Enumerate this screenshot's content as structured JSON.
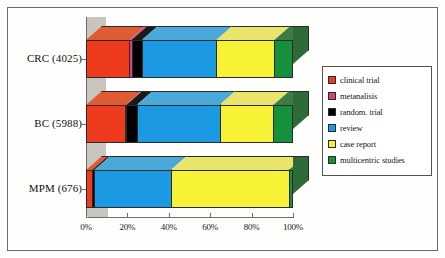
{
  "chart_data": {
    "type": "bar",
    "orientation": "horizontal",
    "stacked": true,
    "normalized_percent": true,
    "title": "",
    "xlabel": "",
    "ylabel": "",
    "xlim": [
      0,
      100
    ],
    "grid": false,
    "legend_position": "right",
    "categories": [
      "CRC (4025)",
      "BC (5988)",
      "MPM (676)"
    ],
    "xtick_labels": [
      "0%",
      "20%",
      "40%",
      "60%",
      "80%",
      "100%"
    ],
    "xtick_values": [
      0,
      20,
      40,
      60,
      80,
      100
    ],
    "series": [
      {
        "name": "clinical trial",
        "color": "#ef3b1d",
        "top_color": "#e05a32",
        "side_color": "#b82d15",
        "values": [
          21,
          19,
          3
        ]
      },
      {
        "name": "metanalisis",
        "color": "#d1447e",
        "top_color": "#d1447e",
        "side_color": "#a43361",
        "values": [
          1,
          0.5,
          0
        ]
      },
      {
        "name": "random. trial",
        "color": "#000000",
        "top_color": "#1a1a1a",
        "side_color": "#000000",
        "values": [
          5,
          5,
          1
        ]
      },
      {
        "name": "review",
        "color": "#1b9ae3",
        "top_color": "#4aa9d8",
        "side_color": "#1479b0",
        "values": [
          36,
          40,
          37
        ]
      },
      {
        "name": "case report",
        "color": "#f8f237",
        "top_color": "#e9e46a",
        "side_color": "#c9c22c",
        "values": [
          28,
          26,
          57
        ]
      },
      {
        "name": "multicentric studies",
        "color": "#17903c",
        "top_color": "#3f7a44",
        "side_color": "#2f6b38",
        "values": [
          9,
          9.5,
          2
        ]
      }
    ]
  },
  "legend": {
    "items": [
      {
        "label": "clinical trial"
      },
      {
        "label": "metanalisis"
      },
      {
        "label": "random. trial"
      },
      {
        "label": "review"
      },
      {
        "label": "case report"
      },
      {
        "label": "multicentric studies"
      }
    ]
  },
  "axis": {
    "x_labels": [
      "0%",
      "20%",
      "40%",
      "60%",
      "80%",
      "100%"
    ],
    "y_labels": [
      "CRC (4025)",
      "BC (5988)",
      "MPM (676)"
    ]
  },
  "colors": {
    "clinical_trial": "#ef3b1d",
    "metanalisis": "#d1447e",
    "random_trial": "#000000",
    "review": "#1b9ae3",
    "case_report": "#f8f237",
    "multicentric_studies": "#17903c",
    "wall": "#c8c5bd",
    "frame": "#6d6d6d"
  }
}
